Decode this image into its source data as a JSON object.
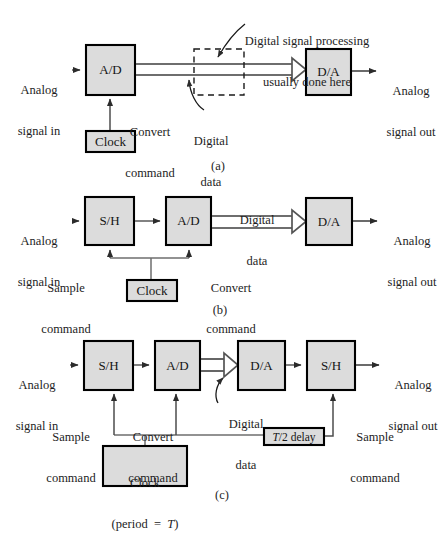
{
  "figure": {
    "colors": {
      "box_fill": "#dcdcdc",
      "box_stroke": "#000000",
      "line": "#4d4d4d",
      "bus": "#6e6e6e",
      "text": "#1a1a1a"
    },
    "panels": [
      {
        "id": "a",
        "caption": "(a)",
        "blocks": [
          {
            "name": "ad-block",
            "label": "A/D"
          },
          {
            "name": "dsp-region",
            "label": ""
          },
          {
            "name": "da-block",
            "label": "D/A"
          },
          {
            "name": "clock-block",
            "label": "Clock"
          }
        ],
        "labels": [
          {
            "name": "analog-in-label",
            "text": "Analog\nsignal in"
          },
          {
            "name": "analog-out-label",
            "text": "Analog\nsignal out"
          },
          {
            "name": "dsp-note-label",
            "text": "Digital signal processing\nusually done here"
          },
          {
            "name": "convert-command-label",
            "text": "Convert\ncommand"
          },
          {
            "name": "digital-data-label",
            "text": "Digital\ndata"
          }
        ]
      },
      {
        "id": "b",
        "caption": "(b)",
        "blocks": [
          {
            "name": "sh-block",
            "label": "S/H"
          },
          {
            "name": "ad-block",
            "label": "A/D"
          },
          {
            "name": "da-block",
            "label": "D/A"
          },
          {
            "name": "clock-block",
            "label": "Clock"
          }
        ],
        "labels": [
          {
            "name": "analog-in-label",
            "text": "Analog\nsignal in"
          },
          {
            "name": "analog-out-label",
            "text": "Analog\nsignal out"
          },
          {
            "name": "digital-data-label",
            "text": "Digital\ndata"
          },
          {
            "name": "sample-command-label",
            "text": "Sample\ncommand"
          },
          {
            "name": "convert-command-label",
            "text": "Convert\ncommand"
          }
        ]
      },
      {
        "id": "c",
        "caption": "(c)",
        "blocks": [
          {
            "name": "sh-block-1",
            "label": "S/H"
          },
          {
            "name": "ad-block",
            "label": "A/D"
          },
          {
            "name": "da-block",
            "label": "D/A"
          },
          {
            "name": "sh-block-2",
            "label": "S/H"
          },
          {
            "name": "delay-block",
            "label": "delay"
          },
          {
            "name": "clock-block",
            "label": "Clock"
          }
        ],
        "labels": [
          {
            "name": "analog-in-label",
            "text": "Analog\nsignal in"
          },
          {
            "name": "analog-out-label",
            "text": "Analog\nsignal out"
          },
          {
            "name": "digital-data-label",
            "text": "Digital\ndata"
          },
          {
            "name": "sample-command-left-label",
            "text": "Sample\ncommand"
          },
          {
            "name": "convert-command-label",
            "text": "Convert\ncommand"
          },
          {
            "name": "sample-command-right-label",
            "text": "Sample\ncommand"
          }
        ]
      }
    ]
  },
  "panel_a": {
    "analog_in_line1": "Analog",
    "analog_in_line2": "signal in",
    "ad_label": "A/D",
    "dsp_note_line1": "Digital signal processing",
    "dsp_note_line2": "usually done here",
    "digital_data_line1": "Digital",
    "digital_data_line2": "data",
    "da_label": "D/A",
    "analog_out_line1": "Analog",
    "analog_out_line2": "signal out",
    "convert_line1": "Convert",
    "convert_line2": "command",
    "clock_label": "Clock",
    "caption": "(a)"
  },
  "panel_b": {
    "analog_in_line1": "Analog",
    "analog_in_line2": "signal in",
    "sh_label": "S/H",
    "ad_label": "A/D",
    "digital_data_line1": "Digital",
    "digital_data_line2": "data",
    "da_label": "D/A",
    "analog_out_line1": "Analog",
    "analog_out_line2": "signal out",
    "sample_line1": "Sample",
    "sample_line2": "command",
    "convert_line1": "Convert",
    "convert_line2": "command",
    "clock_label": "Clock",
    "caption": "(b)"
  },
  "panel_c": {
    "analog_in_line1": "Analog",
    "analog_in_line2": "signal in",
    "sh1_label": "S/H",
    "ad_label": "A/D",
    "da_label": "D/A",
    "sh2_label": "S/H",
    "digital_data_line1": "Digital",
    "digital_data_line2": "data",
    "analog_out_line1": "Analog",
    "analog_out_line2": "signal out",
    "sample_left_line1": "Sample",
    "sample_left_line2": "command",
    "convert_line1": "Convert",
    "convert_line2": "command",
    "sample_right_line1": "Sample",
    "sample_right_line2": "command",
    "delay_t": "T",
    "delay_rest": "/2 delay",
    "clock_line1": "Clock",
    "clock_period_prefix": "(period  =  ",
    "clock_period_t": "T",
    "clock_period_suffix": ")",
    "caption": "(c)"
  }
}
